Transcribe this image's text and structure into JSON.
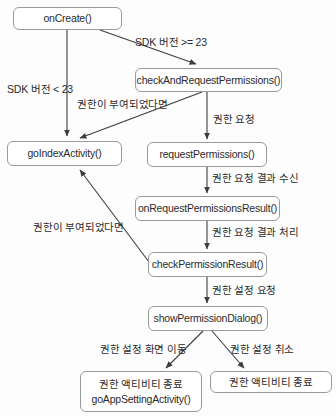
{
  "colors": {
    "bg": "#fdfdfd",
    "box_border": "#9a9a9a",
    "text": "#2b2b2b",
    "arrow": "#3d3d3d"
  },
  "diagram": {
    "nodes": [
      {
        "id": "onCreate",
        "label": "onCreate()"
      },
      {
        "id": "checkAndRequestPermissions",
        "label": "checkAndRequestPermissions()"
      },
      {
        "id": "goIndexActivity",
        "label": "goIndexActivity()"
      },
      {
        "id": "requestPermissions",
        "label": "requestPermissions()"
      },
      {
        "id": "onRequestPermissionsResult",
        "label": "onRequestPermissionsResult()"
      },
      {
        "id": "checkPermissionResult",
        "label": "checkPermissionResult()"
      },
      {
        "id": "showPermissionDialog",
        "label": "showPermissionDialog()"
      },
      {
        "id": "goAppSettingActivity",
        "label_line1": "권한 액티비티 종료",
        "label_line2": "goAppSettingActivity()"
      },
      {
        "id": "finishPermissionActivity",
        "label": "권한 액티비티 종료"
      }
    ],
    "edges": [
      {
        "from": "onCreate",
        "to": "goIndexActivity",
        "label": "SDK 버전 < 23"
      },
      {
        "from": "onCreate",
        "to": "checkAndRequestPermissions",
        "label": "SDK 버전 >= 23"
      },
      {
        "from": "checkAndRequestPermissions",
        "to": "goIndexActivity",
        "label": "권한이 부여되었다면"
      },
      {
        "from": "checkAndRequestPermissions",
        "to": "requestPermissions",
        "label": "권한 요청"
      },
      {
        "from": "requestPermissions",
        "to": "onRequestPermissionsResult",
        "label": "권한 요청 결과 수신"
      },
      {
        "from": "onRequestPermissionsResult",
        "to": "checkPermissionResult",
        "label": "권한 요청 결과 처리"
      },
      {
        "from": "checkPermissionResult",
        "to": "goIndexActivity",
        "label": "권한이 부여되었다면"
      },
      {
        "from": "checkPermissionResult",
        "to": "showPermissionDialog",
        "label": "권한 설정 요청"
      },
      {
        "from": "showPermissionDialog",
        "to": "goAppSettingActivity",
        "label": "권한 설정 화면 이동"
      },
      {
        "from": "showPermissionDialog",
        "to": "finishPermissionActivity",
        "label": "권한 설정 취소"
      }
    ]
  }
}
